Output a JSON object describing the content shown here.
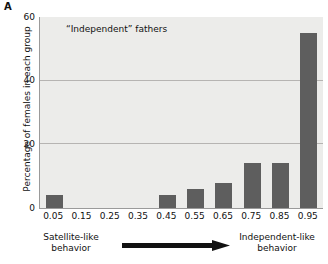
{
  "panel": {
    "letter": "A"
  },
  "chart_data": {
    "type": "bar",
    "title": "“Independent” fathers",
    "xlabel": "",
    "ylabel": "Percentage of females in each group",
    "categories": [
      "0.05",
      "0.15",
      "0.25",
      "0.35",
      "0.45",
      "0.55",
      "0.65",
      "0.75",
      "0.85",
      "0.95"
    ],
    "values": [
      4,
      0,
      0,
      0,
      4,
      6,
      8,
      14,
      14,
      55
    ],
    "ylim": [
      0,
      60
    ],
    "yticks": [
      0,
      20,
      40,
      60
    ],
    "ytick_labels": [
      "0",
      "20",
      "40",
      "60"
    ],
    "grid": true,
    "gridlines_at": [
      20,
      40
    ],
    "legend": "none",
    "bar_color": "#5e5e5e",
    "plot_background": "#ececea",
    "axis_color": "#9a9a9a",
    "annotations": {
      "left_label": "Satellite-like\nbehavior",
      "left_label_line1": "Satellite-like",
      "left_label_line2": "behavior",
      "right_label_line1": "Independent-like",
      "right_label_line2": "behavior",
      "arrow_direction": "left-to-right",
      "arrow_color": "#111111"
    }
  }
}
